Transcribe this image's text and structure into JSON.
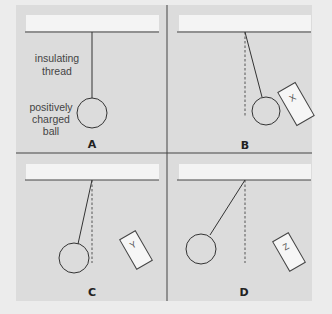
{
  "figure": {
    "background_color": "#ececec",
    "panel_color": "#dcdcdc",
    "ceiling_color": "#f4f4f4",
    "line_color": "#444444"
  },
  "annotations": {
    "thread_line1": "insulating",
    "thread_line2": "thread",
    "ball_line1": "positively",
    "ball_line2": "charged",
    "ball_line3": "ball"
  },
  "panels": [
    {
      "label": "A",
      "object": null,
      "deflection": "none"
    },
    {
      "label": "B",
      "object": "X",
      "deflection": "toward object"
    },
    {
      "label": "C",
      "object": "Y",
      "deflection": "away from object"
    },
    {
      "label": "D",
      "object": "Z",
      "deflection": "away from object (large)"
    }
  ]
}
